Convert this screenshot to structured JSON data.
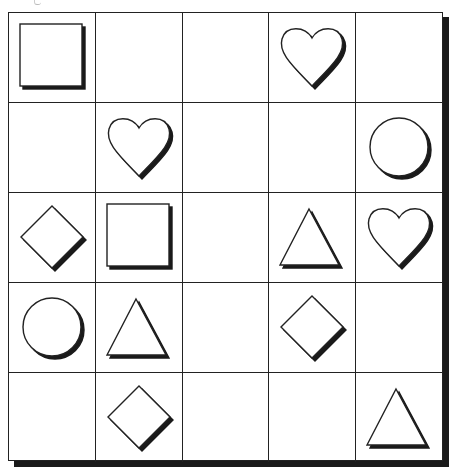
{
  "puzzle": {
    "rows": 5,
    "cols": 5,
    "colors": {
      "line": "#222222",
      "shadow": "#1a1a1a",
      "fill": "#ffffff",
      "background": "#ffffff"
    },
    "grid": [
      [
        "square",
        "",
        "",
        "heart",
        ""
      ],
      [
        "",
        "heart",
        "",
        "",
        "circle"
      ],
      [
        "diamond",
        "square",
        "",
        "triangle",
        "heart"
      ],
      [
        "circle",
        "triangle",
        "",
        "diamond",
        ""
      ],
      [
        "",
        "diamond",
        "",
        "",
        "triangle"
      ]
    ]
  }
}
